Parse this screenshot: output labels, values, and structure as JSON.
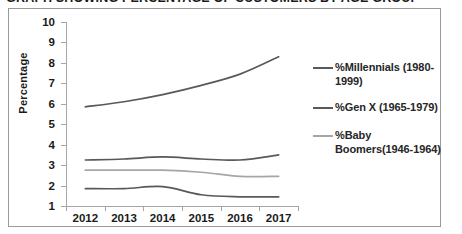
{
  "title": "GRAPH SHOWING PERCENTAGE OF CUSTOMERS BY AGE GROUP",
  "chart_data": {
    "type": "line",
    "title": "GRAPH SHOWING PERCENTAGE OF CUSTOMERS BY AGE GROUP",
    "xlabel": "",
    "ylabel": "Percentage",
    "categories": [
      "2012",
      "2013",
      "2014",
      "2015",
      "2016",
      "2017"
    ],
    "ylim": [
      1,
      10
    ],
    "y_ticks": [
      1,
      2,
      3,
      4,
      5,
      6,
      7,
      8,
      9,
      10
    ],
    "grid": false,
    "legend_position": "right",
    "series": [
      {
        "name": "%Millennials (1980-1999)",
        "color": "#595959",
        "values": [
          5.85,
          6.1,
          6.45,
          6.9,
          7.45,
          8.3
        ]
      },
      {
        "name": "%Gen X (1965-1979)",
        "color": "#595959",
        "values": [
          3.25,
          3.3,
          3.4,
          3.3,
          3.25,
          3.5
        ]
      },
      {
        "name": "%Baby Boomers(1946-1964)",
        "color": "#a6a6a6",
        "values": [
          2.75,
          2.75,
          2.75,
          2.65,
          2.45,
          2.45
        ]
      },
      {
        "name": "series-4",
        "color": "#595959",
        "values": [
          1.85,
          1.85,
          1.95,
          1.55,
          1.45,
          1.45
        ]
      }
    ]
  },
  "axis": {
    "y_title": "Percentage",
    "y_labels": [
      "10",
      "9",
      "8",
      "7",
      "6",
      "5",
      "4",
      "3",
      "2",
      "1"
    ],
    "x_labels": [
      "2012",
      "2013",
      "2014",
      "2015",
      "2016",
      "2017"
    ]
  },
  "legend": {
    "entries": [
      {
        "label": "%Millennials (1980-1999)",
        "color": "#595959"
      },
      {
        "label": "%Gen X (1965-1979)",
        "color": "#595959"
      },
      {
        "label": "%Baby Boomers(1946-1964)",
        "color": "#a6a6a6"
      }
    ]
  }
}
